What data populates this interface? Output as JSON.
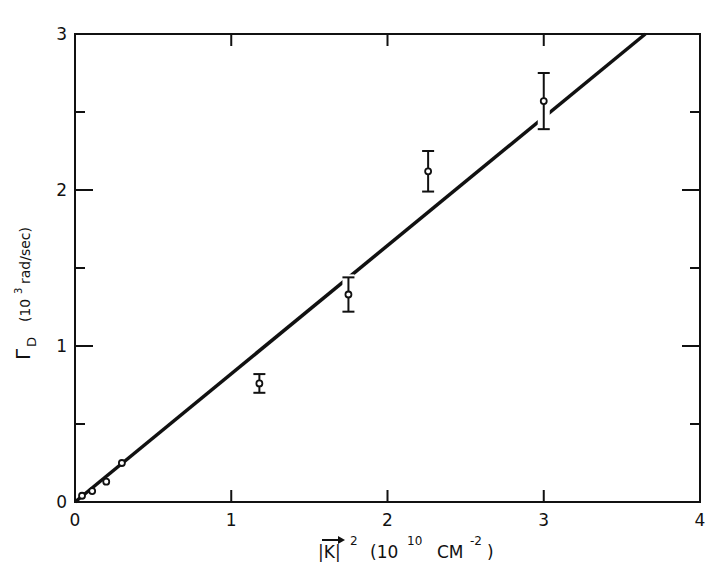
{
  "chart_data": {
    "type": "scatter",
    "title": "",
    "xlabel": "|K|^2 (10^10 CM^-2)",
    "ylabel": "Γ_D (10^3 rad/sec)",
    "xlim": [
      0,
      4
    ],
    "ylim": [
      0,
      3
    ],
    "x_ticks": [
      "0",
      "1",
      "2",
      "3",
      "4"
    ],
    "y_ticks": [
      "0",
      "1",
      "2",
      "3"
    ],
    "grid": false,
    "legend": null,
    "series": [
      {
        "name": "measured",
        "type": "scatter_errorbar",
        "x": [
          0.045,
          0.11,
          0.2,
          0.3,
          1.18,
          1.75,
          2.26,
          3.0
        ],
        "y": [
          0.04,
          0.07,
          0.13,
          0.25,
          0.76,
          1.33,
          2.12,
          2.57
        ],
        "yerr": [
          0,
          0,
          0,
          0,
          0.06,
          0.11,
          0.13,
          0.18
        ]
      },
      {
        "name": "linear fit",
        "type": "line",
        "x": [
          0,
          3.65
        ],
        "y": [
          0,
          3.0
        ]
      }
    ]
  },
  "labels": {
    "x_axis": {
      "base": "|K|",
      "exp": "2",
      "unit_open": "(10",
      "unit_exp": "10",
      "unit_mid": "CM",
      "unit_exp2": "-2",
      "unit_close": ")"
    },
    "y_axis": {
      "symbol": "Γ",
      "sub": "D",
      "unit": "(10",
      "unit_exp": "3",
      "unit_rest": "rad/sec)"
    }
  }
}
